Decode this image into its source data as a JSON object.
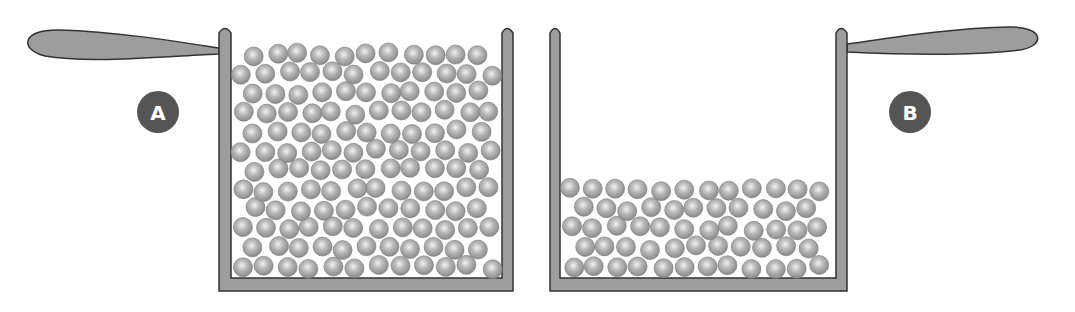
{
  "diagram": {
    "colors": {
      "wall": "#9a9a9a",
      "wall_stroke": "#2e2e2e",
      "ball": "#a8a8a8",
      "ball_highlight": "#eeeeee",
      "badge": "#555555",
      "badge_text": "#ffffff"
    },
    "pots": [
      {
        "id": "A",
        "label": "A",
        "handle_side": "left",
        "fill_level": "full"
      },
      {
        "id": "B",
        "label": "B",
        "handle_side": "right",
        "fill_level": "low"
      }
    ]
  }
}
